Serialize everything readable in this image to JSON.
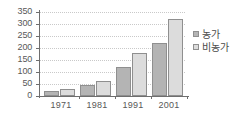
{
  "chart_data": {
    "type": "bar",
    "title": "",
    "subtitle": "",
    "xlabel": "",
    "ylabel": "",
    "categories": [
      "1971",
      "1981",
      "1991",
      "2001"
    ],
    "series": [
      {
        "name": "농가",
        "values": [
          20,
          45,
          120,
          222
        ],
        "color": "#b4b4b4"
      },
      {
        "name": "비농가",
        "values": [
          30,
          62,
          178,
          320
        ],
        "color": "#dcdcdc"
      }
    ],
    "ylim": [
      0,
      350
    ],
    "ytick_values": [
      0,
      50,
      100,
      150,
      200,
      250,
      300,
      350
    ],
    "ytick_labels": [
      "0",
      "50",
      "100",
      "150",
      "200",
      "250",
      "300",
      "350"
    ],
    "grid": true,
    "grid_style": "dotted-horizontal",
    "legend_position": "right",
    "annotations": []
  },
  "legend": {
    "entries": [
      {
        "label": "농가",
        "swatch": "legend-swatch-dark"
      },
      {
        "label": "비농가",
        "swatch": "legend-swatch-light"
      }
    ]
  },
  "colors": {
    "series_dark": "#b4b4b4",
    "series_light": "#dcdcdc",
    "axis": "#6e6e6e",
    "grid": "#c9c9c9",
    "text": "#4a4a4a",
    "background": "#ffffff"
  }
}
